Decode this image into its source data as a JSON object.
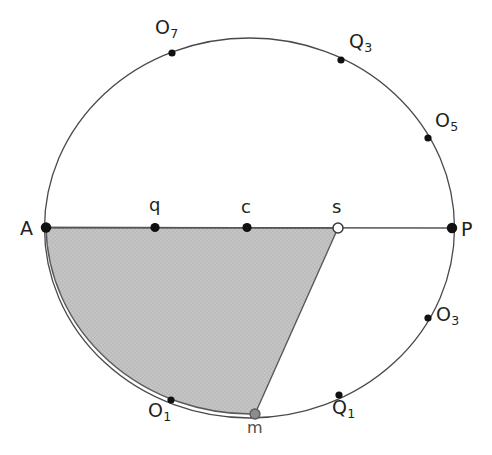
{
  "figure": {
    "type": "circle-geometry-diagram",
    "background_color": "#ffffff",
    "stroke_color": "#4a4a4a",
    "chord_color": "#555555",
    "shaded_region_fill": "#bcbcbc",
    "shaded_region_stroke": "#5a5a5a",
    "label_color": "#231f20",
    "circle": {
      "center_x": 249.5,
      "center_y": 228,
      "radius_x": 205,
      "radius_y": 190
    },
    "diameter_line": {
      "from": "A",
      "to": "P"
    },
    "shaded_region": {
      "description": "circular-segment-sector bounded by chord A-s, line s-m and arc m-A",
      "vertices": [
        "A",
        "s",
        "m"
      ],
      "arc_from": "m",
      "arc_to": "A"
    },
    "points": [
      {
        "id": "A",
        "label": "A",
        "sub": "",
        "x": 46,
        "y": 227.5,
        "marker": "filled-black",
        "radius": 5.2,
        "label_x": 20,
        "label_y": 219,
        "label_size": 19
      },
      {
        "id": "P",
        "label": "P",
        "sub": "",
        "x": 452,
        "y": 228,
        "marker": "filled-black",
        "radius": 5.2,
        "label_x": 461,
        "label_y": 220,
        "label_size": 19
      },
      {
        "id": "q",
        "label": "q",
        "sub": "",
        "x": 155,
        "y": 227.5,
        "marker": "filled-black",
        "radius": 4.6,
        "label_x": 149,
        "label_y": 196,
        "label_size": 18
      },
      {
        "id": "c",
        "label": "c",
        "sub": "",
        "x": 247,
        "y": 227.5,
        "marker": "filled-black",
        "radius": 4.6,
        "label_x": 241,
        "label_y": 198,
        "label_size": 18
      },
      {
        "id": "s",
        "label": "s",
        "sub": "",
        "x": 338,
        "y": 228,
        "marker": "hollow-white",
        "radius": 5.0,
        "label_x": 332,
        "label_y": 198,
        "label_size": 18
      },
      {
        "id": "m",
        "label": "m",
        "sub": "",
        "x": 255,
        "y": 414,
        "marker": "filled-gray",
        "radius": 5.0,
        "label_x": 247,
        "label_y": 420,
        "label_size": 16
      },
      {
        "id": "O7",
        "label": "O",
        "sub": "7",
        "x": 172,
        "y": 53,
        "marker": "filled-black",
        "radius": 3.6,
        "label_x": 155,
        "label_y": 18,
        "label_size": 19
      },
      {
        "id": "Q3",
        "label": "Q",
        "sub": "3",
        "x": 341,
        "y": 60,
        "marker": "filled-black",
        "radius": 3.6,
        "label_x": 349,
        "label_y": 32,
        "label_size": 19
      },
      {
        "id": "O5",
        "label": "O",
        "sub": "5",
        "x": 428,
        "y": 138,
        "marker": "filled-black",
        "radius": 3.6,
        "label_x": 435,
        "label_y": 111,
        "label_size": 19
      },
      {
        "id": "O3",
        "label": "O",
        "sub": "3",
        "x": 428,
        "y": 318,
        "marker": "filled-black",
        "radius": 3.6,
        "label_x": 436,
        "label_y": 305,
        "label_size": 19
      },
      {
        "id": "Q1",
        "label": "Q",
        "sub": "1",
        "x": 339,
        "y": 395,
        "marker": "filled-black",
        "radius": 3.6,
        "label_x": 332,
        "label_y": 398,
        "label_size": 19
      },
      {
        "id": "O1",
        "label": "O",
        "sub": "1",
        "x": 171,
        "y": 400,
        "marker": "filled-black",
        "radius": 3.6,
        "label_x": 148,
        "label_y": 401,
        "label_size": 19
      }
    ]
  }
}
